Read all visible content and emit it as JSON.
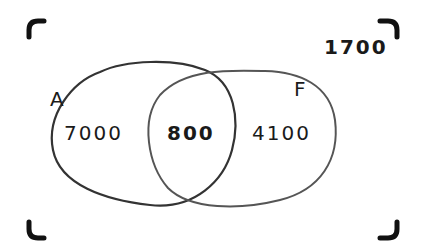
{
  "diagram": {
    "type": "venn",
    "sets": [
      {
        "label": "A",
        "only_value": "7000"
      },
      {
        "label": "F",
        "only_value": "4100"
      }
    ],
    "intersection_value": "800",
    "outside_value": "1700"
  },
  "colors": {
    "stroke": "#333333",
    "frame_corner": "#111111",
    "frame_edge": "#bdbdbd",
    "text": "#1a1a1a"
  }
}
